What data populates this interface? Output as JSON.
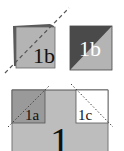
{
  "diagram": {
    "top_left_tile": {
      "label": "1b",
      "back_color": "#555555",
      "front_color": "#b4b4b4"
    },
    "top_right_tile": {
      "label": "1b",
      "dark_color": "#4a4a4a",
      "light_color": "#b4b4b4",
      "label_color": "#ffffff"
    },
    "bottom_tile": {
      "label": "1",
      "base_color": "#bdbdbd",
      "sub_left": {
        "label": "1a",
        "color": "#9a9a9a"
      },
      "sub_right": {
        "label": "1c",
        "color": "#ffffff"
      }
    },
    "line_color": "#555555"
  }
}
